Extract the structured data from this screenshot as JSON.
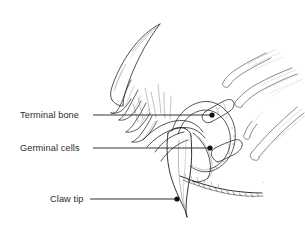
{
  "figure": {
    "background_color": "#ffffff",
    "ink_color": "#1a1a1a",
    "line_color": "#3a3a3a",
    "shading_color": "#9a9a9a",
    "width": 305,
    "height": 236
  },
  "labels": [
    {
      "id": "terminal-bone",
      "text": "Terminal bone",
      "text_x": 20,
      "text_y": 118,
      "leader_start_x": 93,
      "leader_start_y": 115,
      "leader_end_x": 212,
      "leader_end_y": 115,
      "dot_x": 212,
      "dot_y": 115,
      "dot_radius": 2.6
    },
    {
      "id": "germinal-cells",
      "text": "Germinal cells",
      "text_x": 20,
      "text_y": 151,
      "leader_start_x": 93,
      "leader_start_y": 148,
      "leader_end_x": 210,
      "leader_end_y": 148,
      "dot_x": 210,
      "dot_y": 148,
      "dot_radius": 2.6
    },
    {
      "id": "claw-tip",
      "text": "Claw tip",
      "text_x": 50,
      "text_y": 202,
      "leader_start_x": 90,
      "leader_start_y": 199,
      "leader_end_x": 177,
      "leader_end_y": 199,
      "dot_x": 177,
      "dot_y": 199,
      "dot_radius": 2.6
    }
  ],
  "anatomy_parts": [
    {
      "id": "upper-claw",
      "name": "upper claw / dewclaw sheath"
    },
    {
      "id": "claw-sheath-layers",
      "name": "keratin sheath layers"
    },
    {
      "id": "terminal-bone-shape",
      "name": "terminal phalanx bone"
    },
    {
      "id": "germinal-layer",
      "name": "germinal cell layer"
    },
    {
      "id": "main-claw",
      "name": "main claw body"
    },
    {
      "id": "claw-point",
      "name": "claw tip point"
    },
    {
      "id": "fur-edge",
      "name": "fur margin of toe pad"
    },
    {
      "id": "hair-shafts",
      "name": "hair shafts"
    }
  ]
}
